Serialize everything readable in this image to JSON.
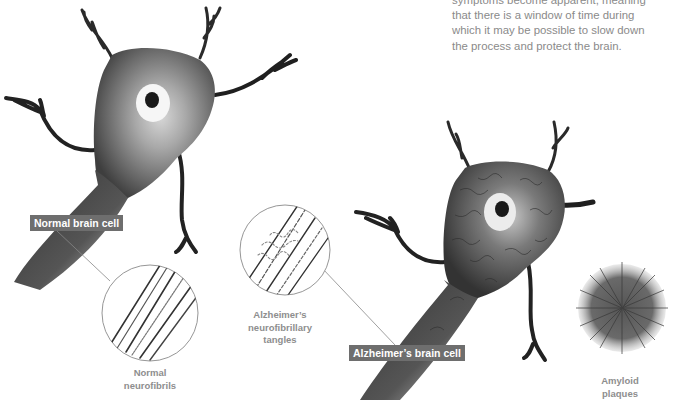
{
  "intro_text": {
    "lines": [
      "symptoms become apparent, meaning",
      "that there is a window of time during",
      "which it may be possible to slow down",
      "the process and protect the brain."
    ]
  },
  "labels": {
    "normal_cell": "Normal brain cell",
    "alzheimers_cell": "Alzheimer’s brain cell"
  },
  "captions": {
    "normal_neurofibrils": [
      "Normal",
      "neurofibrils"
    ],
    "neurofibrillary_tangles": [
      "Alzheimer’s",
      "neurofibrillary",
      "tangles"
    ],
    "amyloid_plaques": [
      "Amyloid",
      "plaques"
    ]
  },
  "colors": {
    "label_bg": "#6e6e6e",
    "caption_text": "#8e8e8e",
    "body_text": "#8a8a8a",
    "cell_dark": "#2a2a2a",
    "cell_mid": "#707070"
  }
}
